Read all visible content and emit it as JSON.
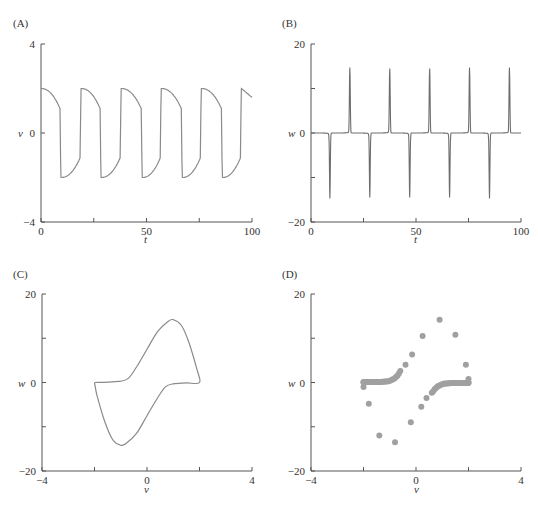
{
  "colors": {
    "line": "#8a8a8a",
    "spike": "#6e6e6e",
    "dots": "#a0a0a0",
    "axis": "#555555"
  },
  "chart_data": [
    {
      "panel": "(A)",
      "type": "line",
      "title": "",
      "xlabel": "t",
      "ylabel": "v",
      "xlim": [
        0,
        100
      ],
      "ylim": [
        -4,
        4
      ],
      "xticks": [
        0,
        50,
        100
      ],
      "xminor": [
        25,
        75
      ],
      "yticks": [
        4,
        0,
        -4
      ],
      "grid": false,
      "description": "Relaxation oscillation; v ranges approx -2 to 2 with period ~19",
      "period": 19,
      "upstrokes_t": [
        0,
        19,
        38,
        57,
        76,
        95
      ],
      "downstrokes_t": [
        9,
        28,
        47.5,
        66.5,
        85.5
      ],
      "v_max": 2.0,
      "v_min": -2.0,
      "v_end": 1.6
    },
    {
      "panel": "(B)",
      "type": "line",
      "title": "",
      "xlabel": "t",
      "ylabel": "w",
      "xlim": [
        0,
        100
      ],
      "ylim": [
        -20,
        20
      ],
      "xticks": [
        0,
        50,
        100
      ],
      "xminor": [
        25,
        75
      ],
      "yticks": [
        20,
        0,
        -20
      ],
      "yminor": [
        10,
        -10
      ],
      "grid": false,
      "description": "Derivative spikes: positive at upstrokes, negative at downstrokes",
      "positive_spikes": [
        {
          "t": 18.5,
          "w": 14.5
        },
        {
          "t": 37.5,
          "w": 14.5
        },
        {
          "t": 56.5,
          "w": 14.5
        },
        {
          "t": 75.5,
          "w": 14.5
        },
        {
          "t": 94.5,
          "w": 14.5
        }
      ],
      "negative_spikes": [
        {
          "t": 9,
          "w": -14.5
        },
        {
          "t": 28,
          "w": -14.5
        },
        {
          "t": 47,
          "w": -14.5
        },
        {
          "t": 66,
          "w": -14.5
        },
        {
          "t": 85,
          "w": -14.5
        }
      ]
    },
    {
      "panel": "(C)",
      "type": "line",
      "title": "",
      "xlabel": "v",
      "ylabel": "w",
      "xlim": [
        -4,
        4
      ],
      "ylim": [
        -20,
        20
      ],
      "xticks": [
        -4,
        0,
        4
      ],
      "xminor": [
        -2,
        2
      ],
      "yticks": [
        20,
        0,
        -20
      ],
      "yminor": [
        10,
        -10
      ],
      "grid": false,
      "description": "Closed phase-plane loop",
      "points": [
        [
          -2.0,
          0.0
        ],
        [
          -1.5,
          0.1
        ],
        [
          -1.0,
          0.3
        ],
        [
          -0.7,
          1.0
        ],
        [
          -0.4,
          3.5
        ],
        [
          0.0,
          7.5
        ],
        [
          0.4,
          11.5
        ],
        [
          0.8,
          13.8
        ],
        [
          1.0,
          14.2
        ],
        [
          1.3,
          13.0
        ],
        [
          1.6,
          9.0
        ],
        [
          1.9,
          3.0
        ],
        [
          2.0,
          0.0
        ],
        [
          1.5,
          -0.1
        ],
        [
          1.0,
          -0.3
        ],
        [
          0.7,
          -1.0
        ],
        [
          0.4,
          -3.5
        ],
        [
          0.0,
          -7.5
        ],
        [
          -0.4,
          -11.5
        ],
        [
          -0.8,
          -13.8
        ],
        [
          -1.0,
          -14.2
        ],
        [
          -1.3,
          -13.0
        ],
        [
          -1.6,
          -9.0
        ],
        [
          -1.9,
          -3.0
        ],
        [
          -2.0,
          0.0
        ]
      ]
    },
    {
      "panel": "(D)",
      "type": "scatter",
      "title": "",
      "xlabel": "v",
      "ylabel": "w",
      "xlim": [
        -4,
        4
      ],
      "ylim": [
        -20,
        20
      ],
      "xticks": [
        -4,
        0,
        4
      ],
      "xminor": [
        -2,
        2
      ],
      "yticks": [
        20,
        0,
        -20
      ],
      "yminor": [
        10,
        -10
      ],
      "grid": false,
      "description": "Sampled phase-plane points; dense clusters near w=0 branches",
      "points": [
        [
          -2.0,
          0.1
        ],
        [
          -1.95,
          0.1
        ],
        [
          -1.9,
          0.1
        ],
        [
          -1.85,
          0.1
        ],
        [
          -1.8,
          0.1
        ],
        [
          -1.75,
          0.1
        ],
        [
          -1.7,
          0.1
        ],
        [
          -1.65,
          0.1
        ],
        [
          -1.6,
          0.1
        ],
        [
          -1.55,
          0.1
        ],
        [
          -1.5,
          0.1
        ],
        [
          -1.45,
          0.1
        ],
        [
          -1.4,
          0.12
        ],
        [
          -1.35,
          0.12
        ],
        [
          -1.3,
          0.15
        ],
        [
          -1.25,
          0.15
        ],
        [
          -1.2,
          0.2
        ],
        [
          -1.15,
          0.2
        ],
        [
          -1.1,
          0.25
        ],
        [
          -1.05,
          0.3
        ],
        [
          -1.0,
          0.4
        ],
        [
          -0.95,
          0.5
        ],
        [
          -0.9,
          0.65
        ],
        [
          -0.85,
          0.8
        ],
        [
          -0.8,
          1.0
        ],
        [
          -0.75,
          1.3
        ],
        [
          -0.7,
          1.6
        ],
        [
          -0.65,
          2.0
        ],
        [
          -0.6,
          2.6
        ],
        [
          -0.4,
          4.0
        ],
        [
          -0.15,
          6.3
        ],
        [
          0.25,
          10.5
        ],
        [
          0.9,
          14.2
        ],
        [
          1.5,
          10.8
        ],
        [
          1.9,
          4.0
        ],
        [
          2.0,
          0.8
        ],
        [
          2.0,
          0.0
        ],
        [
          2.0,
          -0.1
        ],
        [
          1.95,
          -0.1
        ],
        [
          1.9,
          -0.1
        ],
        [
          1.85,
          -0.1
        ],
        [
          1.8,
          -0.1
        ],
        [
          1.75,
          -0.1
        ],
        [
          1.7,
          -0.1
        ],
        [
          1.65,
          -0.1
        ],
        [
          1.6,
          -0.1
        ],
        [
          1.55,
          -0.1
        ],
        [
          1.5,
          -0.1
        ],
        [
          1.45,
          -0.1
        ],
        [
          1.4,
          -0.12
        ],
        [
          1.35,
          -0.12
        ],
        [
          1.3,
          -0.15
        ],
        [
          1.25,
          -0.15
        ],
        [
          1.2,
          -0.2
        ],
        [
          1.15,
          -0.2
        ],
        [
          1.1,
          -0.25
        ],
        [
          1.05,
          -0.3
        ],
        [
          1.0,
          -0.4
        ],
        [
          0.95,
          -0.5
        ],
        [
          0.9,
          -0.65
        ],
        [
          0.85,
          -0.8
        ],
        [
          0.8,
          -1.0
        ],
        [
          0.75,
          -1.3
        ],
        [
          0.7,
          -1.6
        ],
        [
          0.65,
          -2.0
        ],
        [
          0.6,
          -2.3
        ],
        [
          0.4,
          -3.5
        ],
        [
          0.2,
          -5.5
        ],
        [
          -0.2,
          -9.0
        ],
        [
          -0.8,
          -13.5
        ],
        [
          -1.4,
          -12.0
        ],
        [
          -1.8,
          -4.8
        ],
        [
          -2.0,
          -1.0
        ],
        [
          -2.0,
          0.0
        ]
      ]
    }
  ]
}
